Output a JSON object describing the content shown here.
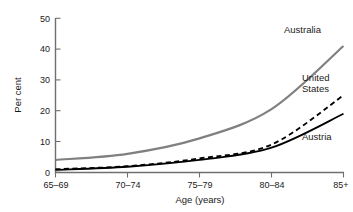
{
  "chart_data": {
    "type": "line",
    "title": "",
    "subtitle": "",
    "xlabel": "Age (years)",
    "ylabel": "Per cent",
    "categories": [
      "65–69",
      "70–74",
      "75–79",
      "80–84",
      "85+"
    ],
    "ylim": [
      0,
      50
    ],
    "yticks": [
      0,
      10,
      20,
      30,
      40,
      50
    ],
    "ytick_labels": [
      "0",
      "10",
      "20",
      "30",
      "40",
      "50"
    ],
    "grid": false,
    "legend_position": "inline-end-of-line",
    "series": [
      {
        "name": "Australia",
        "values": [
          4,
          6,
          11,
          20.5,
          41
        ],
        "color": "#808080",
        "style": "solid",
        "width": 2.2
      },
      {
        "name": "United States",
        "values": [
          1,
          2,
          4.5,
          9,
          25
        ],
        "color": "#000000",
        "style": "dashed",
        "width": 1.8
      },
      {
        "name": "Austria",
        "values": [
          0.8,
          1.8,
          4,
          8,
          19
        ],
        "color": "#000000",
        "style": "solid",
        "width": 1.8
      }
    ],
    "annotations": [
      {
        "text": "Australia",
        "series": "Australia"
      },
      {
        "text": "United",
        "series": "United States"
      },
      {
        "text": "States",
        "series": "United States"
      },
      {
        "text": "Austria",
        "series": "Austria"
      }
    ]
  },
  "axes": {
    "y_label": "Per cent",
    "x_label": "Age (years)"
  },
  "labels": {
    "australia": "Australia",
    "united": "United",
    "states": "States",
    "austria": "Austria"
  },
  "yticks": {
    "t0": "0",
    "t1": "10",
    "t2": "20",
    "t3": "30",
    "t4": "40",
    "t5": "50"
  },
  "xticks": {
    "t0": "65–69",
    "t1": "70–74",
    "t2": "75–79",
    "t3": "80–84",
    "t4": "85+"
  },
  "colors": {
    "australia": "#808080",
    "united_states": "#000000",
    "austria": "#000000",
    "axis": "#6f6f6f",
    "background": "#ffffff"
  }
}
